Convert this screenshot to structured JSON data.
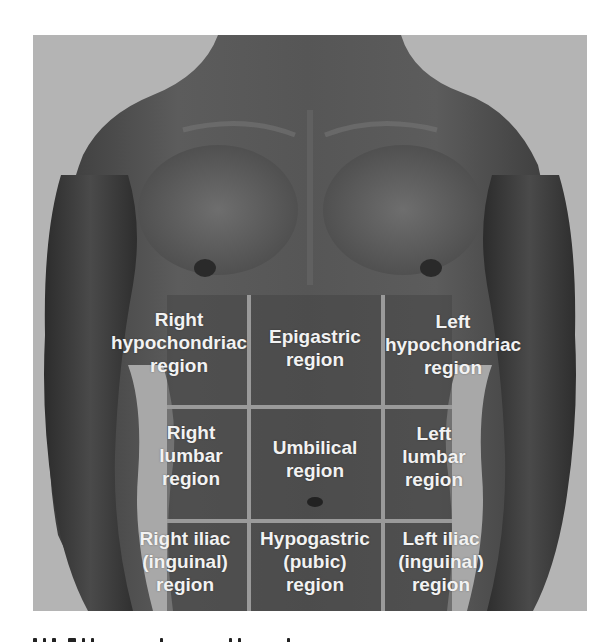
{
  "figure": {
    "colors": {
      "background": "#b4b4b4",
      "gridline": "#9a9a9a",
      "label": "#f2f2f2",
      "skin_dark": "#3c3c3c",
      "skin_mid": "#5a5a5a"
    },
    "grid": {
      "vertical_x": [
        215,
        350
      ],
      "horizontal_y": [
        372,
        486
      ],
      "vertical_top": 260,
      "horizontal_left": 134,
      "horizontal_right": 419
    },
    "regions": [
      {
        "row": 0,
        "col": 0,
        "lines": [
          "Right",
          "hypochondriac",
          "region"
        ]
      },
      {
        "row": 0,
        "col": 1,
        "lines": [
          "Epigastric",
          "region"
        ]
      },
      {
        "row": 0,
        "col": 2,
        "lines": [
          "Left",
          "hypochondriac",
          "region"
        ]
      },
      {
        "row": 1,
        "col": 0,
        "lines": [
          "Right",
          "lumbar",
          "region"
        ]
      },
      {
        "row": 1,
        "col": 1,
        "lines": [
          "Umbilical",
          "region"
        ]
      },
      {
        "row": 1,
        "col": 2,
        "lines": [
          "Left",
          "lumbar",
          "region"
        ]
      },
      {
        "row": 2,
        "col": 0,
        "lines": [
          "Right iliac",
          "(inguinal)",
          "region"
        ]
      },
      {
        "row": 2,
        "col": 1,
        "lines": [
          "Hypogastric",
          "(pubic)",
          "region"
        ]
      },
      {
        "row": 2,
        "col": 2,
        "lines": [
          "Left iliac",
          "(inguinal)",
          "region"
        ]
      }
    ]
  }
}
